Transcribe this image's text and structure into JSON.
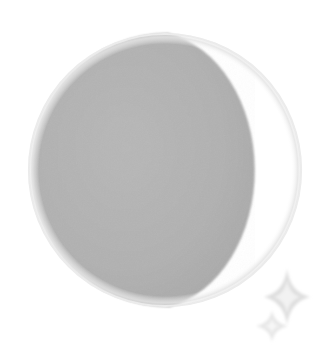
{
  "image": {
    "title": "Moon phase illustration",
    "subject": "moon",
    "phase_name": "Waning Gibbous",
    "illumination_side": "right",
    "shadow_side": "left",
    "alt_text": "A circular moon with the left portion shaded gray and the right portion white, with two sparkles at the lower right",
    "background_color": "#ffffff",
    "width": 324,
    "height": 358
  },
  "moon": {
    "label": "moon-disc",
    "center_x": 165,
    "center_y": 170,
    "radius": 137,
    "shadow_color": "#b0b0b0",
    "shadow_edge_color": "#9b9b9b",
    "lit_color": "#ffffff",
    "outline_color": "#e8e8e8",
    "outline_width": 2,
    "terminator_x_mid": 194,
    "terminator_top_x": 168,
    "terminator_top_y": 30,
    "terminator_bottom_x": 170,
    "terminator_bottom_y": 312
  },
  "sparkles": [
    {
      "label": "sparkle-large",
      "center_x": 287,
      "center_y": 297,
      "radius_long": 28,
      "radius_short": 6,
      "color": "#e2e2e2"
    },
    {
      "label": "sparkle-small",
      "center_x": 272,
      "center_y": 326,
      "radius_long": 16,
      "radius_short": 4,
      "color": "#ebebeb"
    }
  ]
}
